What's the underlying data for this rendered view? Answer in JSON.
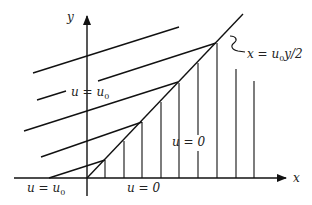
{
  "diagram": {
    "title": "",
    "axes": {
      "x_label": "x",
      "y_label": "y",
      "origin": [
        87,
        178
      ]
    },
    "labels": {
      "region_left_upper": {
        "text": "u = u",
        "sub": "0"
      },
      "region_left_lower": {
        "text": "u = u",
        "sub": "0"
      },
      "region_right_upper": {
        "text": "u = 0"
      },
      "region_right_lower": {
        "text": "u = 0"
      },
      "shock_line": {
        "text": "x = u",
        "sub": "0",
        "tail": "y/2"
      }
    },
    "characteristics_left": [
      {
        "from": [
          33,
          73
        ],
        "to": [
          179,
          27
        ]
      },
      {
        "from": [
          37,
          100
        ],
        "to": [
          66,
          91
        ],
        "gap_label": true
      },
      {
        "from": [
          98,
          81
        ],
        "to": [
          216,
          43
        ]
      },
      {
        "from": [
          24,
          131
        ],
        "to": [
          178,
          82
        ]
      },
      {
        "from": [
          41,
          157
        ],
        "to": [
          142,
          122
        ]
      },
      {
        "from": [
          49,
          178
        ],
        "to": [
          105,
          160
        ]
      }
    ],
    "characteristics_right_x": [
      105,
      124,
      142,
      161,
      179,
      198,
      217,
      236,
      254
    ],
    "shock": {
      "from": [
        87,
        178
      ],
      "to": [
        243,
        14
      ]
    },
    "colors": {
      "line": "#111111",
      "background": "#ffffff"
    }
  }
}
